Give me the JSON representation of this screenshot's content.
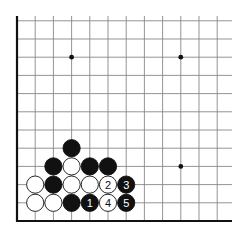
{
  "diagram": {
    "type": "go-board-corner",
    "grid": {
      "origin_x": 17,
      "bottom_y": 221,
      "spacing": 18.2,
      "columns": 12,
      "rows": 12,
      "right_extent": 232,
      "top_extent": 16,
      "line_color": "#888888",
      "edge_color": "#111111"
    },
    "star_points": [
      {
        "col": 3,
        "row": 9
      },
      {
        "col": 9,
        "row": 9
      },
      {
        "col": 9,
        "row": 3
      }
    ],
    "stones": [
      {
        "col": 3,
        "row": 4,
        "color": "black",
        "label": ""
      },
      {
        "col": 2,
        "row": 3,
        "color": "black",
        "label": ""
      },
      {
        "col": 3,
        "row": 3,
        "color": "white",
        "label": ""
      },
      {
        "col": 4,
        "row": 3,
        "color": "black",
        "label": ""
      },
      {
        "col": 5,
        "row": 3,
        "color": "black",
        "label": ""
      },
      {
        "col": 1,
        "row": 2,
        "color": "white",
        "label": ""
      },
      {
        "col": 2,
        "row": 2,
        "color": "black",
        "label": ""
      },
      {
        "col": 3,
        "row": 2,
        "color": "white",
        "label": ""
      },
      {
        "col": 4,
        "row": 2,
        "color": "white",
        "label": ""
      },
      {
        "col": 5,
        "row": 2,
        "color": "white",
        "label": "2"
      },
      {
        "col": 6,
        "row": 2,
        "color": "black",
        "label": "3"
      },
      {
        "col": 1,
        "row": 1,
        "color": "white",
        "label": ""
      },
      {
        "col": 2,
        "row": 1,
        "color": "white",
        "label": ""
      },
      {
        "col": 3,
        "row": 1,
        "color": "black",
        "label": ""
      },
      {
        "col": 4,
        "row": 1,
        "color": "black",
        "label": "1"
      },
      {
        "col": 5,
        "row": 1,
        "color": "white",
        "label": "4"
      },
      {
        "col": 6,
        "row": 1,
        "color": "black",
        "label": "5"
      }
    ]
  }
}
